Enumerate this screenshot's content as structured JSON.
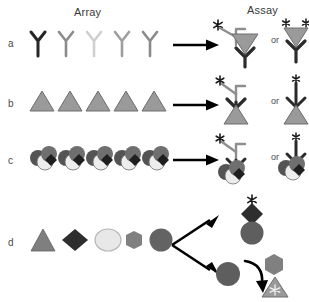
{
  "figure": {
    "title_array": "Array",
    "title_assay": "Assay",
    "or_label": "or",
    "bottom_caption": "",
    "row_labels": [
      "a",
      "b",
      "c",
      "d"
    ]
  },
  "colors": {
    "background": "#ffffff",
    "text": "#3a3a3a",
    "outline": "#2b2b2b",
    "antibody_dark": "#262626",
    "antibody_mid": "#7d7d7d",
    "antibody_light": "#c9c9c9",
    "antibody_light2": "#a8a8a8",
    "antibody_mid2": "#8e8e8e",
    "triangle_fill": "#9a9a9a",
    "triangle_stroke": "#6e6e6e",
    "diamond_fill": "#2e2e2e",
    "circle_light": "#e8e8e8",
    "circle_light_stroke": "#b4b4b4",
    "hexagon_fill": "#808080",
    "circle_dark": "#636363",
    "cell_dark": "#545454",
    "cell_light": "#ededed",
    "cell_mid": "#6f6f6f",
    "arrow": "#000000",
    "star": "#1a1a1a"
  },
  "rows": [
    {
      "id": "a",
      "label": "a",
      "array_legend": "antibody dilution series",
      "array_items": [
        {
          "shape": "antibody-y",
          "shade": "#262626"
        },
        {
          "shape": "antibody-y",
          "shade": "#8b8b8b"
        },
        {
          "shape": "antibody-y",
          "shade": "#cfcfcf"
        },
        {
          "shape": "antibody-y",
          "shade": "#9e9e9e"
        },
        {
          "shape": "antibody-y",
          "shade": "#8a8a8a"
        }
      ],
      "arrow": "straight",
      "assay_variants": [
        {
          "id": "a-sandwich",
          "description": "capture antibody, triangle antigen, labeled detection antibody",
          "elements": [
            "capture-antibody",
            "antigen-triangle",
            "detection-antibody",
            "label-star"
          ]
        },
        {
          "id": "a-direct",
          "description": "capture antibody with directly double-labeled triangle antigen",
          "elements": [
            "capture-antibody",
            "antigen-triangle",
            "label-star",
            "label-star"
          ]
        }
      ]
    },
    {
      "id": "b",
      "label": "b",
      "array_legend": "immobilized antigen series",
      "array_items": [
        {
          "shape": "triangle",
          "shade": "#9a9a9a"
        },
        {
          "shape": "triangle",
          "shade": "#9a9a9a"
        },
        {
          "shape": "triangle",
          "shade": "#9a9a9a"
        },
        {
          "shape": "triangle",
          "shade": "#9a9a9a"
        },
        {
          "shape": "triangle",
          "shade": "#9a9a9a"
        }
      ],
      "arrow": "straight",
      "assay_variants": [
        {
          "id": "b-indirect",
          "description": "antigen triangle bound by primary antibody plus labeled secondary antibody",
          "elements": [
            "antigen-triangle",
            "primary-antibody",
            "secondary-antibody",
            "label-star"
          ]
        },
        {
          "id": "b-direct",
          "description": "antigen triangle bound by directly labeled antibody",
          "elements": [
            "antigen-triangle",
            "primary-antibody",
            "label-star"
          ]
        }
      ]
    },
    {
      "id": "c",
      "label": "c",
      "array_legend": "cell or complex antigen cluster series",
      "array_items": [
        {
          "shape": "cell-cluster",
          "shade": "#545454"
        },
        {
          "shape": "cell-cluster",
          "shade": "#545454"
        },
        {
          "shape": "cell-cluster",
          "shade": "#545454"
        },
        {
          "shape": "cell-cluster",
          "shade": "#545454"
        },
        {
          "shape": "cell-cluster",
          "shade": "#545454"
        }
      ],
      "arrow": "straight",
      "assay_variants": [
        {
          "id": "c-indirect",
          "description": "cell cluster bound by primary antibody plus labeled secondary antibody",
          "elements": [
            "cell-cluster",
            "primary-antibody",
            "secondary-antibody",
            "label-star"
          ]
        },
        {
          "id": "c-direct",
          "description": "cell cluster bound by directly labeled antibody",
          "elements": [
            "cell-cluster",
            "primary-antibody",
            "label-star"
          ]
        }
      ]
    },
    {
      "id": "d",
      "label": "d",
      "array_legend": "small molecule and compound series",
      "array_items": [
        {
          "shape": "triangle",
          "shade": "#7f7f7f"
        },
        {
          "shape": "diamond",
          "shade": "#2e2e2e"
        },
        {
          "shape": "circle",
          "shade": "#e8e8e8"
        },
        {
          "shape": "hexagon",
          "shade": "#808080"
        },
        {
          "shape": "circle",
          "shade": "#636363"
        }
      ],
      "arrow": "branched",
      "assay_variants": [
        {
          "id": "d-binding",
          "description": "labeled diamond ligand binding to dark circular target",
          "elements": [
            "label-star",
            "diamond-ligand",
            "circle-target"
          ]
        },
        {
          "id": "d-enzymatic",
          "description": "circular enzyme converts hexagon substrate to activated triangle product",
          "elements": [
            "circle-enzyme",
            "hexagon-substrate",
            "curved-arrow",
            "triangle-product-burst"
          ]
        }
      ]
    }
  ]
}
